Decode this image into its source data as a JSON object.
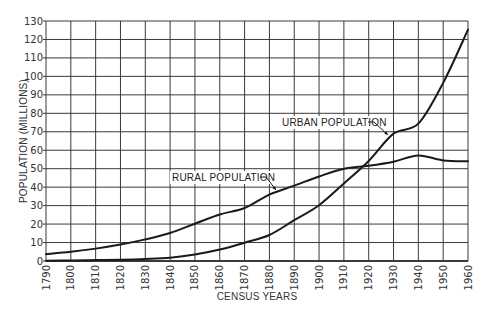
{
  "chart_data": {
    "type": "line",
    "title": "",
    "xlabel": "CENSUS YEARS",
    "ylabel": "POPULATION (MILLIONS)",
    "xlim": [
      1790,
      1960
    ],
    "ylim": [
      0,
      130
    ],
    "grid": true,
    "x": [
      1790,
      1800,
      1810,
      1820,
      1830,
      1840,
      1850,
      1860,
      1870,
      1880,
      1890,
      1900,
      1910,
      1920,
      1930,
      1940,
      1950,
      1960
    ],
    "x_tick_labels": [
      "1790",
      "1800",
      "1810",
      "1820",
      "1830",
      "1840",
      "1850",
      "1860",
      "1870",
      "1880",
      "1890",
      "1900",
      "1910",
      "1920",
      "1930",
      "1940",
      "1950",
      "1960"
    ],
    "y_ticks": [
      0,
      10,
      20,
      30,
      40,
      50,
      60,
      70,
      80,
      90,
      100,
      110,
      120,
      130
    ],
    "y_tick_labels": [
      "0",
      "10",
      "20",
      "30",
      "40",
      "50",
      "60",
      "70",
      "80",
      "90",
      "100",
      "110",
      "120",
      "130"
    ],
    "series": [
      {
        "name": "RURAL POPULATION",
        "values": [
          3.7,
          5.0,
          6.7,
          8.9,
          11.7,
          15.2,
          20.2,
          25.2,
          28.7,
          36.0,
          40.8,
          45.8,
          50.0,
          51.6,
          53.8,
          57.2,
          54.5,
          54.0
        ],
        "label_anchor": {
          "x": 172,
          "y": 181
        },
        "leader": {
          "from": [
            260,
            177
          ],
          "to": [
            276,
            190
          ]
        }
      },
      {
        "name": "URBAN POPULATION",
        "values": [
          0.2,
          0.3,
          0.5,
          0.7,
          1.1,
          1.8,
          3.5,
          6.2,
          9.9,
          14.1,
          22.1,
          30.2,
          42.0,
          54.2,
          69.0,
          74.4,
          96.5,
          125.3
        ],
        "label_anchor": {
          "x": 282,
          "y": 126
        },
        "leader": {
          "from": [
            368,
            122
          ],
          "to": [
            388,
            135
          ]
        }
      }
    ]
  },
  "colors": {
    "line": "#1a1a1a",
    "grid": "#3a3a3a",
    "background": "#ffffff",
    "text": "#333333"
  }
}
